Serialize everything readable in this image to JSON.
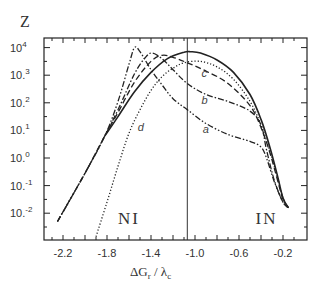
{
  "chart_data": {
    "type": "line",
    "title": "",
    "ylabel": "Z",
    "xlabel": "ΔG_r / λ_c",
    "xlabel_parts": {
      "main": "ΔG",
      "sub1": "r",
      "sep": " / λ",
      "sub2": "c"
    },
    "yscale": "log",
    "xlim": [
      -2.33,
      -0.1
    ],
    "ylim_log10": [
      -3,
      4.4
    ],
    "x_ticks": [
      -2.2,
      -1.8,
      -1.4,
      -1.0,
      -0.6,
      -0.2
    ],
    "x_tick_labels": [
      "-2.2",
      "-1.8",
      "-1.4",
      "-1.0",
      "-0.6",
      "-0.2"
    ],
    "y_ticks_log10": [
      4,
      3,
      2,
      1,
      0,
      -1,
      -2
    ],
    "y_tick_labels": [
      {
        "base": "10",
        "exp": "4"
      },
      {
        "base": "10.",
        "exp": "3"
      },
      {
        "base": "10.",
        "exp": "2"
      },
      {
        "base": "10.",
        "exp": "1"
      },
      {
        "base": "10.",
        "exp": "0"
      },
      {
        "base": "10.",
        "exp": "-1"
      },
      {
        "base": "10.",
        "exp": "-2"
      }
    ],
    "vertical_line_x": -1.07,
    "grid": false,
    "legend": "none (inline curve labels)",
    "annotations": [
      {
        "text": "NI",
        "x": -1.7,
        "log10y": -2.4
      },
      {
        "text": "IN",
        "x": -0.45,
        "log10y": -2.4
      }
    ],
    "series": [
      {
        "name": "a",
        "style": "dash-dot-dot",
        "x": [
          -2.25,
          -2.0,
          -1.82,
          -1.7,
          -1.6,
          -1.55,
          -1.5,
          -1.4,
          -1.3,
          -1.2,
          -1.07,
          -0.9,
          -0.7,
          -0.5,
          -0.4,
          -0.35,
          -0.28,
          -0.2,
          -0.15
        ],
        "log10y": [
          -2.3,
          -0.55,
          0.8,
          2.05,
          3.4,
          4.0,
          3.85,
          3.2,
          2.65,
          2.15,
          1.75,
          1.25,
          0.85,
          0.6,
          0.4,
          0.0,
          -0.85,
          -1.6,
          -1.8
        ]
      },
      {
        "name": "b",
        "style": "dash-dot",
        "x": [
          -2.25,
          -2.0,
          -1.82,
          -1.7,
          -1.55,
          -1.45,
          -1.39,
          -1.3,
          -1.2,
          -1.07,
          -0.9,
          -0.7,
          -0.5,
          -0.4,
          -0.35,
          -0.28,
          -0.2,
          -0.15
        ],
        "log10y": [
          -2.3,
          -0.55,
          0.8,
          1.75,
          3.05,
          3.65,
          3.8,
          3.6,
          3.2,
          2.7,
          2.3,
          2.05,
          1.7,
          1.2,
          0.3,
          -0.8,
          -1.6,
          -1.8
        ]
      },
      {
        "name": "c",
        "style": "dashed",
        "x": [
          -2.25,
          -2.0,
          -1.82,
          -1.7,
          -1.55,
          -1.4,
          -1.3,
          -1.2,
          -1.07,
          -0.9,
          -0.7,
          -0.5,
          -0.4,
          -0.32,
          -0.25,
          -0.2,
          -0.15
        ],
        "log10y": [
          -2.3,
          -0.55,
          0.8,
          1.65,
          2.75,
          3.5,
          3.72,
          3.65,
          3.45,
          3.15,
          2.7,
          1.9,
          1.1,
          0.2,
          -0.8,
          -1.5,
          -1.8
        ]
      },
      {
        "name": "solid",
        "style": "solid",
        "x": [
          -1.82,
          -1.7,
          -1.55,
          -1.4,
          -1.25,
          -1.1,
          -1.04,
          -0.95,
          -0.8,
          -0.65,
          -0.5,
          -0.4,
          -0.32,
          -0.25,
          -0.2,
          -0.15
        ],
        "log10y": [
          0.8,
          1.5,
          2.4,
          3.1,
          3.6,
          3.83,
          3.85,
          3.8,
          3.55,
          3.1,
          2.3,
          1.4,
          0.4,
          -0.65,
          -1.45,
          -1.8
        ]
      },
      {
        "name": "d",
        "style": "dotted",
        "x": [
          -1.9,
          -1.8,
          -1.7,
          -1.6,
          -1.5,
          -1.4,
          -1.3,
          -1.2,
          -1.1,
          -0.95,
          -0.8,
          -0.65,
          -0.5,
          -0.4,
          -0.32,
          -0.25,
          -0.2,
          -0.15
        ],
        "log10y": [
          -2.85,
          -1.6,
          -0.3,
          0.9,
          1.75,
          2.45,
          2.95,
          3.25,
          3.45,
          3.5,
          3.3,
          2.85,
          2.05,
          1.2,
          0.25,
          -0.7,
          -1.45,
          -1.8
        ]
      }
    ],
    "curve_labels": [
      {
        "text": "a",
        "x": -0.93,
        "log10y": 0.9
      },
      {
        "text": "b",
        "x": -0.94,
        "log10y": 1.95
      },
      {
        "text": "c",
        "x": -0.94,
        "log10y": 2.95
      },
      {
        "text": "d",
        "x": -1.52,
        "log10y": 0.98
      }
    ]
  }
}
